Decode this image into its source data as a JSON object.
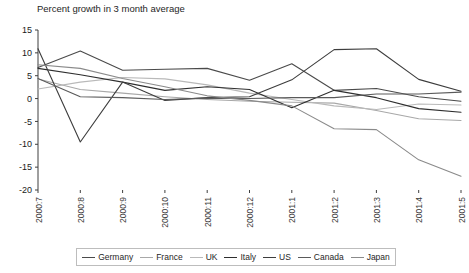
{
  "chart_data": {
    "type": "line",
    "title": "Percent growth in 3 month average",
    "xlabel": "",
    "ylabel": "",
    "ylim": [
      -20,
      15
    ],
    "yticks": [
      15,
      10,
      5,
      0,
      -5,
      -10,
      -15,
      -20
    ],
    "ytick_labels": [
      "15",
      "10",
      "5",
      "0",
      "-5",
      "-10",
      "-15",
      "-20"
    ],
    "grid": false,
    "legend_position": "bottom",
    "categories": [
      "2000:7",
      "2000:8",
      "2000:9",
      "2000:10",
      "2000:11",
      "2000:12",
      "2001:1",
      "2001:2",
      "2001:3",
      "2001:4",
      "2001:5"
    ],
    "series": [
      {
        "name": "Germany",
        "color": "#4a4a4a",
        "values": [
          6.8,
          10.4,
          6.2,
          6.4,
          6.6,
          4.0,
          7.6,
          1.8,
          2.2,
          0.4,
          -0.6
        ]
      },
      {
        "name": "France",
        "color": "#a8a8a8",
        "values": [
          4.3,
          2.0,
          1.2,
          0.4,
          -0.2,
          -0.6,
          -0.8,
          -1.0,
          -2.6,
          -4.4,
          -4.8
        ]
      },
      {
        "name": "UK",
        "color": "#b9b9b9",
        "values": [
          2.1,
          3.6,
          4.6,
          4.3,
          3.0,
          1.2,
          -0.2,
          -1.6,
          -2.4,
          -1.2,
          -1.4
        ]
      },
      {
        "name": "Italy",
        "color": "#2e2e2e",
        "values": [
          6.6,
          5.2,
          3.6,
          1.8,
          2.6,
          2.0,
          -2.0,
          1.8,
          0.2,
          -2.2,
          -3.0
        ]
      },
      {
        "name": "US",
        "color": "#3d3d3d",
        "values": [
          10.9,
          -9.5,
          3.6,
          -0.4,
          0.2,
          0.4,
          4.1,
          10.7,
          10.9,
          4.2,
          1.6
        ]
      },
      {
        "name": "Canada",
        "color": "#5a5a5a",
        "values": [
          4.4,
          0.4,
          0.2,
          -0.2,
          0.1,
          0.0,
          0.2,
          0.2,
          1.0,
          1.0,
          1.4
        ]
      },
      {
        "name": "Japan",
        "color": "#8a8a8a",
        "values": [
          7.4,
          6.6,
          4.4,
          2.6,
          0.6,
          -0.4,
          -1.6,
          -6.6,
          -6.8,
          -13.4,
          -17.0
        ]
      }
    ]
  },
  "legend": {
    "items": [
      {
        "label": "Germany"
      },
      {
        "label": "France"
      },
      {
        "label": "UK"
      },
      {
        "label": "Italy"
      },
      {
        "label": "US"
      },
      {
        "label": "Canada"
      },
      {
        "label": "Japan"
      }
    ]
  }
}
